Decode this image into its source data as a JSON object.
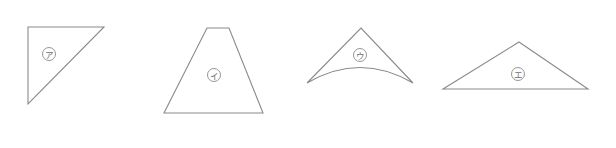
{
  "figure": {
    "stroke_color": "#8a8a8a",
    "background": "#ffffff",
    "shapes": [
      {
        "id": "a",
        "kind": "right-triangle",
        "label": "ア",
        "points": "28,27 104,27 28,104",
        "label_center": [
          49,
          54
        ]
      },
      {
        "id": "i",
        "kind": "trapezoid",
        "label": "イ",
        "points": "207,28 229,28 263,113 164,113",
        "label_center": [
          214,
          75
        ]
      },
      {
        "id": "u",
        "kind": "curved-triangle",
        "label": "ウ",
        "path": "M307,83 L361,28 L413,83 Q360,52 307,83 Z",
        "label_center": [
          360,
          55
        ]
      },
      {
        "id": "e",
        "kind": "obtuse-triangle",
        "label": "エ",
        "points": "519,42 588,89 443,89",
        "label_center": [
          518,
          74
        ]
      }
    ]
  }
}
